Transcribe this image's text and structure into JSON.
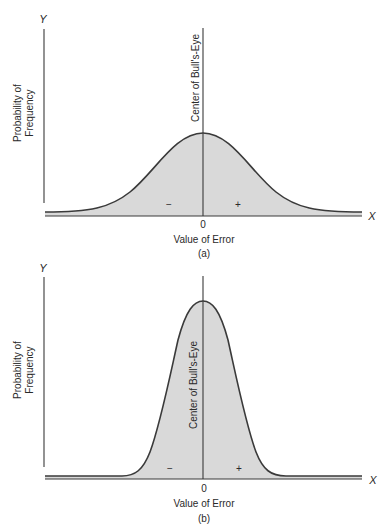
{
  "panels": [
    {
      "id": "a",
      "caption": "(a)",
      "y_axis_label": "Y",
      "x_axis_label": "X",
      "y_title_line1": "Probability of",
      "y_title_line2": "Frequency",
      "x_title": "Value of Error",
      "zero_tick": "0",
      "center_label": "Center of Bull's-Eye",
      "minus_sign": "−",
      "plus_sign": "+",
      "distribution": "wide normal curve (large spread)"
    },
    {
      "id": "b",
      "caption": "(b)",
      "y_axis_label": "Y",
      "x_axis_label": "X",
      "y_title_line1": "Probability of",
      "y_title_line2": "Frequency",
      "x_title": "Value of Error",
      "zero_tick": "0",
      "center_label": "Center of Bull's-Eye",
      "minus_sign": "−",
      "plus_sign": "+",
      "distribution": "narrow normal curve (small spread)"
    }
  ],
  "colors": {
    "fill": "#d9d9d9",
    "line": "#3a3a3a",
    "text": "#2a2a2a"
  }
}
